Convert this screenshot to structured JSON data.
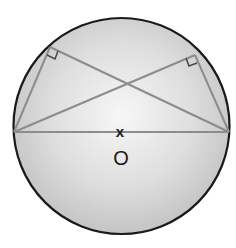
{
  "diagram": {
    "type": "circle-geometry",
    "center_label": "O",
    "center_mark": "x",
    "colors": {
      "circle_stroke": "#1a1a1a",
      "circle_fill_center": "#f6f6f6",
      "circle_fill_edge": "#c8c8c8",
      "chord_stroke": "#8c8c8c",
      "marker_stroke": "#4a4a4a"
    },
    "circle": {
      "cx": 121.5,
      "cy": 126,
      "r": 108
    },
    "points": {
      "A": {
        "x": 14,
        "y": 132,
        "role": "diameter-left-endpoint"
      },
      "B": {
        "x": 229,
        "y": 132,
        "role": "diameter-right-endpoint"
      },
      "C": {
        "x": 50,
        "y": 47,
        "role": "upper-left-point-on-circle"
      },
      "D": {
        "x": 195,
        "y": 55,
        "role": "upper-right-point-on-circle"
      }
    },
    "segments": [
      {
        "from": "A",
        "to": "B",
        "name": "diameter"
      },
      {
        "from": "A",
        "to": "C"
      },
      {
        "from": "A",
        "to": "D"
      },
      {
        "from": "B",
        "to": "C"
      },
      {
        "from": "B",
        "to": "D"
      }
    ],
    "right_angles": [
      {
        "at": "C"
      },
      {
        "at": "D"
      }
    ]
  }
}
